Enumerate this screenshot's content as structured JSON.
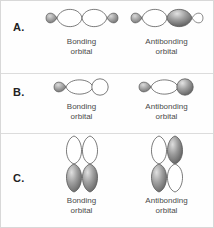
{
  "figure": {
    "background": "#ffffff",
    "border_color": "#d8d8d8",
    "lobe_white": "#ffffff",
    "lobe_gray": "#8d8d8d",
    "lobe_gray_dark": "#5f5f5f",
    "outline": "#5a5a5a",
    "text_color": "#4a4a4a"
  },
  "captions": {
    "bonding_line1": "Bonding",
    "bonding_line2": "orbital",
    "antibonding_line1": "Antibonding",
    "antibonding_line2": "orbital"
  },
  "rows": [
    {
      "letter": "A.",
      "orbital_type": "p-p sigma end-on overlap",
      "bonding": {
        "label_line1": "Bonding",
        "label_line2": "orbital",
        "lobes": [
          "small-gray",
          "large-white",
          "large-white",
          "small-gray"
        ],
        "orientation": "horizontal",
        "phase_match": "in-phase"
      },
      "antibonding": {
        "label_line1": "Antibonding",
        "label_line2": "orbital",
        "lobes": [
          "small-gray",
          "large-white",
          "large-gray",
          "small-white"
        ],
        "orientation": "horizontal",
        "phase_match": "out-of-phase"
      }
    },
    {
      "letter": "B.",
      "orbital_type": "s-p sigma overlap",
      "bonding": {
        "label_line1": "Bonding",
        "label_line2": "orbital",
        "lobes": [
          "small-gray",
          "large-white",
          "s-white-circle"
        ],
        "orientation": "horizontal",
        "phase_match": "in-phase"
      },
      "antibonding": {
        "label_line1": "Antibonding",
        "label_line2": "orbital",
        "lobes": [
          "small-gray",
          "large-white",
          "s-gray-circle"
        ],
        "orientation": "horizontal",
        "phase_match": "out-of-phase"
      }
    },
    {
      "letter": "C.",
      "orbital_type": "p-p pi side-on overlap",
      "bonding": {
        "label_line1": "Bonding",
        "label_line2": "orbital",
        "lobes": [
          "left-top-white",
          "left-bottom-gray",
          "right-top-white",
          "right-bottom-gray"
        ],
        "orientation": "vertical",
        "phase_match": "in-phase"
      },
      "antibonding": {
        "label_line1": "Antibonding",
        "label_line2": "orbital",
        "lobes": [
          "left-top-white",
          "left-bottom-gray",
          "right-top-gray",
          "right-bottom-white"
        ],
        "orientation": "vertical",
        "phase_match": "out-of-phase"
      }
    }
  ]
}
